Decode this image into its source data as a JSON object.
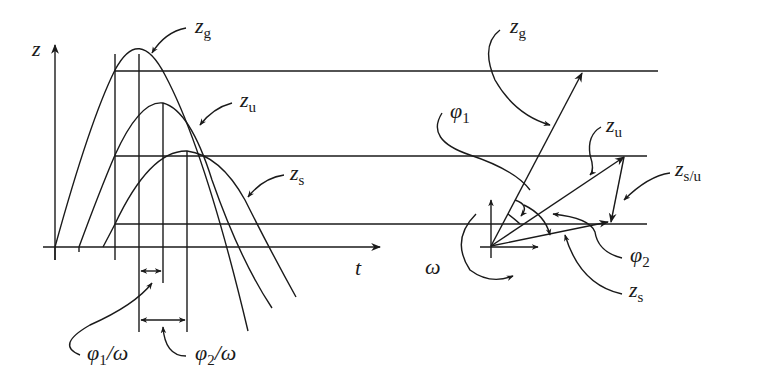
{
  "diagram": {
    "left_panel": {
      "description": "Time-domain sinusoidal responses",
      "y_axis_label": "z",
      "x_axis_label": "t",
      "curves": [
        {
          "base": "z",
          "sub": "g"
        },
        {
          "base": "z",
          "sub": "u"
        },
        {
          "base": "z",
          "sub": "s"
        }
      ],
      "phase_labels": [
        {
          "phi": "φ",
          "sub": "1",
          "den": "/ω"
        },
        {
          "phi": "φ",
          "sub": "2",
          "den": "/ω"
        }
      ]
    },
    "right_panel": {
      "description": "Rotating phasor diagram",
      "vectors": [
        {
          "base": "z",
          "sub": "g"
        },
        {
          "base": "z",
          "sub": "u"
        },
        {
          "base": "z",
          "sub": "s/u"
        },
        {
          "base": "z",
          "sub": "s"
        }
      ],
      "angles": [
        {
          "phi": "φ",
          "sub": "1"
        },
        {
          "phi": "φ",
          "sub": "2"
        }
      ],
      "rotation_label": "ω"
    },
    "colors": {
      "ink": "#1a1a1a",
      "background": "#ffffff"
    }
  }
}
